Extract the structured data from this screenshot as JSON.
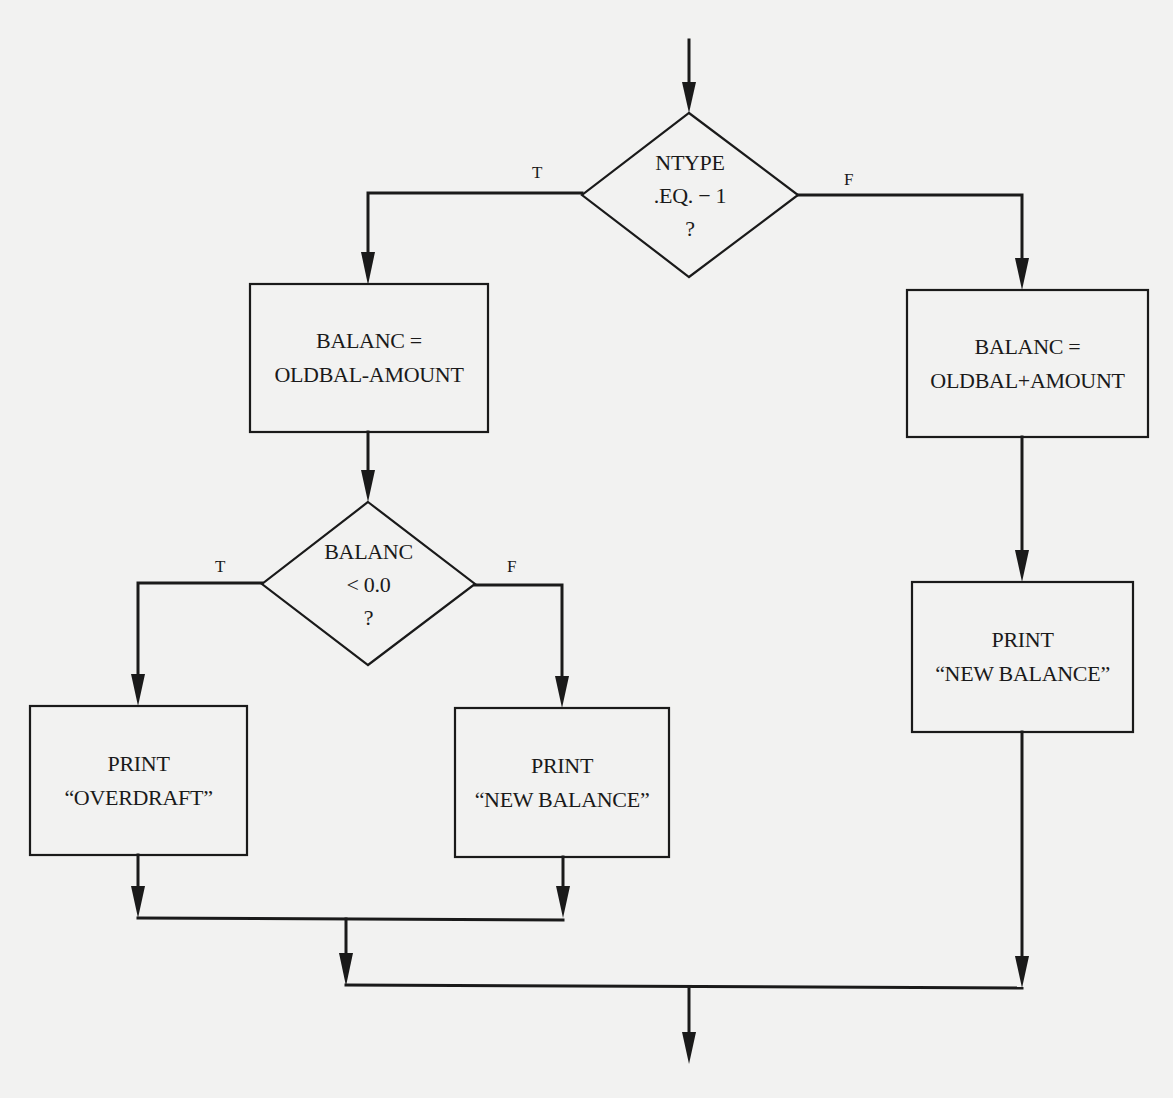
{
  "diagram": {
    "type": "flowchart",
    "colors": {
      "background": "#f2f2f1",
      "stroke": "#1a1a1a",
      "text": "#1a1a1a"
    },
    "nodes": [
      {
        "id": "d1",
        "shape": "diamond",
        "lines": [
          "NTYPE",
          ".EQ. − 1",
          "?"
        ]
      },
      {
        "id": "b1",
        "shape": "process",
        "lines": [
          "BALANC =",
          "OLDBAL-AMOUNT"
        ]
      },
      {
        "id": "b2",
        "shape": "process",
        "lines": [
          "BALANC =",
          "OLDBAL+AMOUNT"
        ]
      },
      {
        "id": "d2",
        "shape": "diamond",
        "lines": [
          "BALANC",
          "< 0.0",
          "?"
        ]
      },
      {
        "id": "b3",
        "shape": "process",
        "lines": [
          "PRINT",
          "“OVERDRAFT”"
        ]
      },
      {
        "id": "b4",
        "shape": "process",
        "lines": [
          "PRINT",
          "“NEW BALANCE”"
        ]
      },
      {
        "id": "b5",
        "shape": "process",
        "lines": [
          "PRINT",
          "“NEW BALANCE”"
        ]
      }
    ],
    "edges": [
      {
        "from": "entry",
        "to": "d1",
        "label": ""
      },
      {
        "from": "d1",
        "to": "b1",
        "label": "T"
      },
      {
        "from": "d1",
        "to": "b2",
        "label": "F"
      },
      {
        "from": "b1",
        "to": "d2",
        "label": ""
      },
      {
        "from": "d2",
        "to": "b3",
        "label": "T"
      },
      {
        "from": "d2",
        "to": "b4",
        "label": "F"
      },
      {
        "from": "b2",
        "to": "b5",
        "label": ""
      },
      {
        "from": "b3",
        "to": "merge",
        "label": ""
      },
      {
        "from": "b4",
        "to": "merge",
        "label": ""
      },
      {
        "from": "b5",
        "to": "merge",
        "label": ""
      },
      {
        "from": "merge",
        "to": "exit",
        "label": ""
      }
    ]
  }
}
